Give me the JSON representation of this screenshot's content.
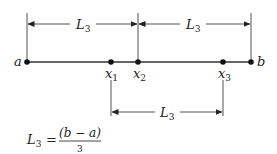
{
  "diagram": {
    "type": "interval-division",
    "colors": {
      "ink": "#222222",
      "line": "#555555",
      "background": "#ffffff"
    },
    "endpoints": [
      {
        "id": "a",
        "label": "a",
        "x": 27
      },
      {
        "id": "b",
        "label": "b",
        "x": 251
      }
    ],
    "points": [
      {
        "id": "x1",
        "label": "x",
        "subscript": "1",
        "x": 111
      },
      {
        "id": "x2",
        "label": "x",
        "subscript": "2",
        "x": 138
      },
      {
        "id": "x3",
        "label": "x",
        "subscript": "3",
        "x": 223
      }
    ],
    "dimensions": [
      {
        "id": "upper-left",
        "label": "L",
        "subscript": "3",
        "from": "a",
        "to": "x2"
      },
      {
        "id": "upper-right",
        "label": "L",
        "subscript": "3",
        "from": "x2",
        "to": "b"
      },
      {
        "id": "lower",
        "label": "L",
        "subscript": "3",
        "from": "x1",
        "to": "x3"
      }
    ],
    "formula": {
      "lhs": "L",
      "lhs_subscript": "3",
      "equals": "=",
      "numerator": "(b − a)",
      "denominator": "3"
    }
  }
}
